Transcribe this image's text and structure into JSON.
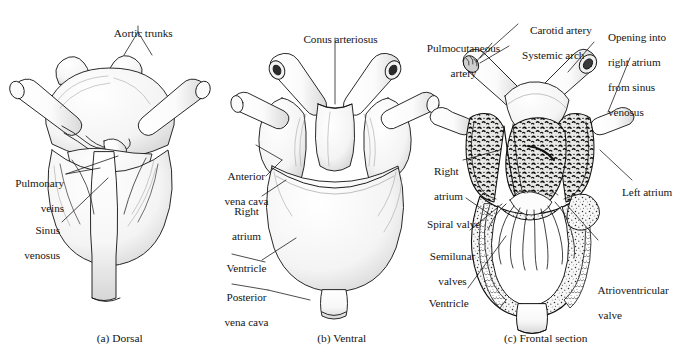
{
  "figure": {
    "background_color": "#ffffff",
    "ink_color": "#111111",
    "panels": [
      {
        "id": "a",
        "caption": "(a) Dorsal",
        "labels": [
          "Aortic trunks",
          "Pulmonary\nveins",
          "Sinus\nvenosus"
        ]
      },
      {
        "id": "b",
        "caption": "(b) Ventral",
        "labels": [
          "Conus arteriosus",
          "Anterior\nvena cava",
          "Right\natrium",
          "Ventricle",
          "Posterior\nvena cava"
        ]
      },
      {
        "id": "c",
        "caption": "(c) Frontal section",
        "labels": [
          "Carotid artery",
          "Pulmocutaneous\nartery",
          "Systemic arch",
          "Opening into\nright atrium\nfrom sinus\nvenosus",
          "Right\natrium",
          "Left atrium",
          "Spiral valve",
          "Semilunar\nvalves",
          "Ventricle",
          "Atrioventricular\nvalve"
        ]
      }
    ]
  },
  "labels": {
    "aortic_trunks": "Aortic trunks",
    "pulmonary_veins_1": "Pulmonary",
    "pulmonary_veins_2": "veins",
    "sinus_venosus_1": "Sinus",
    "sinus_venosus_2": "venosus",
    "conus_arteriosus": "Conus arteriosus",
    "anterior_vena_cava_1": "Anterior",
    "anterior_vena_cava_2": "vena cava",
    "right_atrium_b_1": "Right",
    "right_atrium_b_2": "atrium",
    "ventricle_b": "Ventricle",
    "posterior_vena_cava_1": "Posterior",
    "posterior_vena_cava_2": "vena cava",
    "carotid_artery": "Carotid artery",
    "pulmocutaneous_artery_1": "Pulmocutaneous",
    "pulmocutaneous_artery_2": "artery",
    "systemic_arch": "Systemic arch",
    "opening_sinus_1": "Opening into",
    "opening_sinus_2": "right atrium",
    "opening_sinus_3": "from sinus",
    "opening_sinus_4": "venosus",
    "right_atrium_c_1": "Right",
    "right_atrium_c_2": "atrium",
    "left_atrium_c": "Left atrium",
    "spiral_valve": "Spiral valve",
    "semilunar_valves_1": "Semilunar",
    "semilunar_valves_2": "valves",
    "ventricle_c": "Ventricle",
    "atrioventricular_valve_1": "Atrioventricular",
    "atrioventricular_valve_2": "valve"
  },
  "captions": {
    "a": "(a) Dorsal",
    "b": "(b) Ventral",
    "c": "(c) Frontal section"
  }
}
